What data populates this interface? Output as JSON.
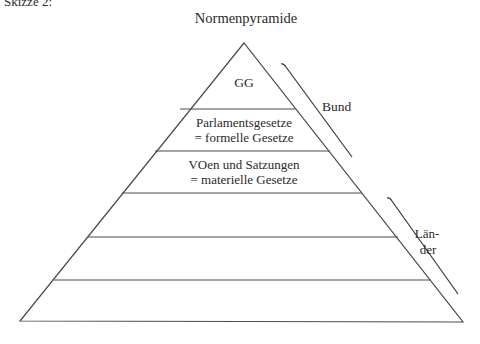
{
  "caption": "Skizze 2:",
  "title": "Normenpyramide",
  "levels": [
    {
      "lines": [
        "GG"
      ]
    },
    {
      "lines": [
        "Parlamentsgesetze",
        "= formelle Gesetze"
      ]
    },
    {
      "lines": [
        "VOen und Satzungen",
        "= materielle Gesetze"
      ]
    },
    {
      "lines": []
    },
    {
      "lines": []
    },
    {
      "lines": []
    }
  ],
  "brackets": {
    "bund": {
      "label": "Bund"
    },
    "laender": {
      "label_line1": "Län-",
      "label_line2": "der"
    }
  },
  "colors": {
    "line": "#4a4a4a",
    "text": "#2a2a2a"
  }
}
